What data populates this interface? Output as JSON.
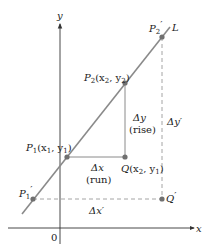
{
  "diagram": {
    "colors": {
      "axis": "#333333",
      "line_L": "#8a8a8a",
      "solid_guides": "#8a8a8a",
      "dashed_guides": "#9a9a9a",
      "points": "#707070",
      "text": "#222222"
    },
    "axes": {
      "x_label": "x",
      "y_label": "y",
      "origin_label": "0"
    },
    "line": {
      "label": "L"
    },
    "points": {
      "P1": {
        "name": "P",
        "sub": "1",
        "coords_prefix": "(x",
        "coords_sub1": "1",
        "coords_mid": ", y",
        "coords_sub2": "1",
        "coords_suffix": ")"
      },
      "P2": {
        "name": "P",
        "sub": "2",
        "coords_prefix": "(x",
        "coords_sub1": "2",
        "coords_mid": ", y",
        "coords_sub2": "2",
        "coords_suffix": ")"
      },
      "Q": {
        "name": "Q",
        "coords_prefix": "(x",
        "coords_sub1": "2",
        "coords_mid": ", y",
        "coords_sub2": "1",
        "coords_suffix": ")"
      },
      "P1_prime": {
        "name": "P",
        "sub": "1",
        "prime": "′"
      },
      "P2_prime": {
        "name": "P",
        "sub": "2",
        "prime": "′"
      },
      "Q_prime": {
        "name": "Q",
        "prime": "′"
      }
    },
    "annotations": {
      "delta_x": "Δx",
      "run": "(run)",
      "delta_y": "Δy",
      "rise": "(rise)",
      "delta_x_prime": "Δx′",
      "delta_y_prime": "Δy′"
    }
  }
}
